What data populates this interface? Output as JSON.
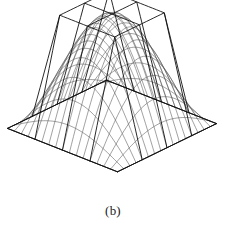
{
  "figure": {
    "caption": "(b)",
    "type": "3d-wireframe-surface-plot",
    "background_color": "#ffffff",
    "mesh_color": "#555555",
    "frame_color": "#111111",
    "plane_color": "#1c1c1c"
  },
  "chart_data": {
    "type": "line",
    "title": "",
    "subtitle": "",
    "xlabel": "",
    "ylabel": "",
    "zlabel": "",
    "render": "wireframe-3d",
    "grid": true,
    "legend": null,
    "axis_ranges": {
      "x": [
        -1,
        1
      ],
      "y": [
        -1,
        1
      ],
      "z": [
        0,
        1
      ]
    },
    "projection": {
      "azimuth_deg": 42,
      "elevation_deg": 26,
      "scale": 74,
      "origin_x": 112,
      "origin_y": 126,
      "z_scale": 112
    },
    "surfaces": [
      {
        "name": "smooth-dome",
        "function": "cos(pi*x/2)*cos(pi*y/2)",
        "mesh_n_u": 17,
        "mesh_n_v": 17,
        "style": "mesh-line"
      },
      {
        "name": "coarse-frustum-interpolant",
        "function": "min(1, 2*(1-max(|x|,|y|)))",
        "mesh_n_u": 5,
        "mesh_n_v": 5,
        "style": "frame-line"
      }
    ],
    "base_outline": {
      "corners_px": [
        [
          17,
          152
        ],
        [
          96,
          112
        ],
        [
          208,
          105
        ],
        [
          148,
          193
        ]
      ]
    },
    "apex_px": [
      96,
      12
    ],
    "series": [
      {
        "name": "dome-height-profile-y0",
        "x": [
          -1.0,
          -0.75,
          -0.5,
          -0.25,
          0.0,
          0.25,
          0.5,
          0.75,
          1.0
        ],
        "values": [
          0.0,
          0.383,
          0.707,
          0.924,
          1.0,
          0.924,
          0.707,
          0.383,
          0.0
        ]
      },
      {
        "name": "frustum-height-profile-y0",
        "x": [
          -1.0,
          -0.75,
          -0.5,
          -0.25,
          0.0,
          0.25,
          0.5,
          0.75,
          1.0
        ],
        "values": [
          0.0,
          0.5,
          1.0,
          1.0,
          1.0,
          1.0,
          1.0,
          0.5,
          0.0
        ]
      }
    ]
  }
}
